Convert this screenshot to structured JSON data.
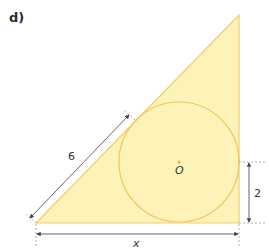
{
  "figure": {
    "part_label": "d)",
    "colors": {
      "fill": "#fdf3b8",
      "outline": "#f2cf6b",
      "circle": "#efc45a",
      "center_dot": "#e8a94a",
      "dimension": "#555555",
      "extension": "#9a9a9a"
    },
    "triangle": {
      "shape": "right triangle",
      "right_angle_at": "bottom-right"
    },
    "circle": {
      "type": "inscribed circle",
      "center_label": "O"
    },
    "dimensions": {
      "hypotenuse_segment": "6",
      "right_segment": "2",
      "base": "x"
    }
  }
}
